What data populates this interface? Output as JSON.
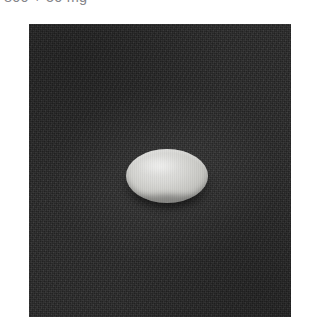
{
  "caption": {
    "text": "800 + 50 mg",
    "color": "#85858a",
    "clipped_at_top": true
  },
  "photo": {
    "alt_name": "oval-tablet-photograph",
    "background_color": "#262626",
    "background_description": "dark near-black textured cloth backdrop",
    "bounds": {
      "x": 29,
      "y": 24,
      "width": 262,
      "height": 293
    },
    "subject": {
      "name": "oval tablet",
      "shape": "oval",
      "color": "#d9d9d6",
      "highlight_color": "#e4e4e2",
      "shadow_color": "#b4b4b0",
      "bounds": {
        "x": 126,
        "y": 149,
        "width": 82,
        "height": 54
      }
    }
  }
}
